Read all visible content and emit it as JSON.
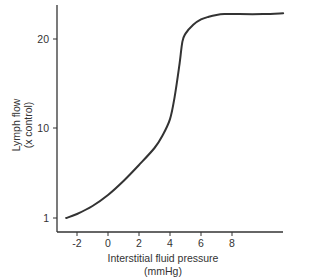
{
  "chart_data": {
    "type": "line",
    "title": "",
    "xlabel": "Interstitial fluid pressure",
    "xlabel_unit": "(mmHg)",
    "ylabel": "Lymph flow",
    "ylabel_unit": "(x control)",
    "x_ticks": [
      -2,
      0,
      2,
      4,
      6,
      8
    ],
    "y_ticks": [
      1,
      10,
      20
    ],
    "xlim": [
      -3.2,
      11.5
    ],
    "ylim": [
      0,
      24
    ],
    "grid": false,
    "legend": null,
    "series": [
      {
        "name": "Lymph flow",
        "x": [
          -2.7,
          -2,
          -1,
          0,
          1,
          2,
          3,
          3.5,
          4,
          4.3,
          4.6,
          4.8,
          5,
          5.5,
          6,
          6.5,
          7,
          7.5,
          8,
          10,
          11.3
        ],
        "y": [
          1.0,
          1.4,
          2.2,
          3.3,
          4.7,
          6.3,
          8.0,
          9.2,
          11.0,
          13.5,
          17.0,
          19.7,
          20.6,
          21.6,
          22.2,
          22.5,
          22.7,
          22.8,
          22.8,
          22.8,
          22.9
        ]
      }
    ]
  },
  "labels": {
    "y_title_line1": "Lymph flow",
    "y_title_line2": "(x control)",
    "x_title_line1": "Interstitial fluid pressure",
    "x_title_line2": "(mmHg)",
    "x_tick_labels": [
      "-2",
      "0",
      "2",
      "4",
      "6",
      "8"
    ],
    "y_tick_labels": [
      "1",
      "10",
      "20"
    ]
  },
  "colors": {
    "line": "#333333",
    "axis": "#333333",
    "background": "#ffffff"
  }
}
